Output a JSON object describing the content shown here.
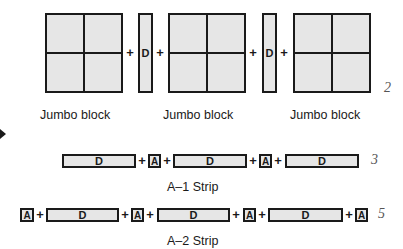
{
  "row1": {
    "jumbo_blocks": [
      {
        "label": "Jumbo block"
      },
      {
        "label": "Jumbo block"
      },
      {
        "label": "Jumbo block"
      }
    ],
    "d_strips": [
      {
        "text": "D"
      },
      {
        "text": "D"
      }
    ],
    "plus": "+",
    "count": "2"
  },
  "row2": {
    "label": "A–1 Strip",
    "pieces": [
      "D",
      "A",
      "D",
      "A",
      "D"
    ],
    "plus": "+",
    "count": "3"
  },
  "row3": {
    "label": "A–2 Strip",
    "pieces": [
      "A",
      "D",
      "A",
      "D",
      "A",
      "D",
      "A"
    ],
    "plus": "+",
    "count": "5"
  },
  "colors": {
    "fill": "#e6e6e6",
    "stroke": "#1a1a1a",
    "count_text": "#555555"
  }
}
